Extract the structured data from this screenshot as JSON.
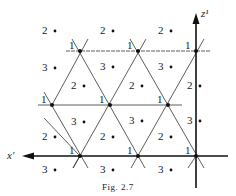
{
  "figure": {
    "caption": "Fig. 2.7",
    "axes": {
      "x_label": "x'",
      "z_label": "z¹"
    },
    "lattice_label": "1",
    "region_labels": [
      {
        "t": "2",
        "x": 42,
        "y": 31
      },
      {
        "t": "2",
        "x": 100,
        "y": 31
      },
      {
        "t": "2",
        "x": 158,
        "y": 31
      },
      {
        "t": "3",
        "x": 42,
        "y": 68
      },
      {
        "t": "3",
        "x": 100,
        "y": 67
      },
      {
        "t": "3",
        "x": 158,
        "y": 67
      },
      {
        "t": "2",
        "x": 71,
        "y": 86
      },
      {
        "t": "2",
        "x": 129,
        "y": 86
      },
      {
        "t": "2",
        "x": 187,
        "y": 86
      },
      {
        "t": "3",
        "x": 71,
        "y": 122
      },
      {
        "t": "3",
        "x": 129,
        "y": 121
      },
      {
        "t": "3",
        "x": 187,
        "y": 121
      },
      {
        "t": "2",
        "x": 42,
        "y": 137
      },
      {
        "t": "2",
        "x": 100,
        "y": 137
      },
      {
        "t": "2",
        "x": 158,
        "y": 137
      },
      {
        "t": "3",
        "x": 42,
        "y": 170
      },
      {
        "t": "3",
        "x": 100,
        "y": 170
      },
      {
        "t": "3",
        "x": 158,
        "y": 170
      }
    ],
    "lattice_points": [
      {
        "x": 80,
        "y": 51
      },
      {
        "x": 138,
        "y": 51
      },
      {
        "x": 196,
        "y": 51
      },
      {
        "x": 52,
        "y": 105
      },
      {
        "x": 110,
        "y": 105
      },
      {
        "x": 168,
        "y": 105
      },
      {
        "x": 80,
        "y": 156
      },
      {
        "x": 138,
        "y": 156
      },
      {
        "x": 196,
        "y": 156
      }
    ]
  }
}
